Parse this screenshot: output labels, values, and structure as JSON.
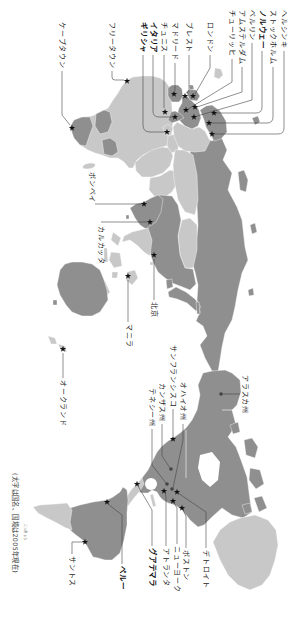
{
  "europe_africa_labels": {
    "helsinki": "ヘルシンキ",
    "stockholm": "ストックホルム",
    "norway": "ノルウェー",
    "berlin": "ベルリン",
    "amsterdam": "アムステルダム",
    "zurich": "チューリッヒ",
    "london": "ロンドン",
    "brest": "ブレスト",
    "madrid": "マドリード",
    "tunis": "チュニス",
    "italy": "イタリア",
    "greece": "ギリシャ",
    "freetown": "フリータウン",
    "cape_town": "ケープタウン"
  },
  "asia_pacific_labels": {
    "bombay": "ボンベイ",
    "calcutta": "カルカッタ",
    "beijing": "北京",
    "manila": "マニラ",
    "auckland": "オークランド"
  },
  "americas_labels": {
    "alaska": "アラスカ州",
    "ohio": "オハイオ州",
    "san_francisco": "サンフランシスコ",
    "kansas": "カンザス州",
    "tennessee": "テネシー州",
    "detroit": "デトロイト",
    "boston": "ボストン",
    "new_york": "ニューヨーク",
    "atlanta": "アトランタ",
    "guatemala": "グアテマラ",
    "peru": "ペルー",
    "santos": "サントス"
  },
  "bold_labels_are_countries": [
    "norway",
    "italy",
    "greece",
    "guatemala",
    "peru"
  ],
  "note": {
    "text": "(太字は国名、国境は2005年現在)",
    "furigana": "こっきょう"
  },
  "markers": {
    "star_icon": "star-marker-icon",
    "dot_icon": "dot-marker-icon"
  },
  "colors": {
    "background": "#ffffff",
    "land_dark": "#8f8f8f",
    "land_light": "#c8c8c8",
    "marker": "#111111",
    "leader_line": "#444444"
  }
}
